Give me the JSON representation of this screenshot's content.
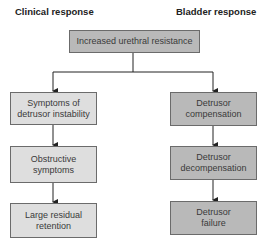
{
  "headers": {
    "left": "Clinical response",
    "right": "Bladder response"
  },
  "root": {
    "label": "Increased urethral resistance"
  },
  "clinical_response": [
    {
      "label": "Symptoms of detrusor instability"
    },
    {
      "label": "Obstructive symptoms"
    },
    {
      "label": "Large residual retention"
    }
  ],
  "bladder_response": [
    {
      "label": "Detrusor compensation"
    },
    {
      "label": "Detrusor decompensation"
    },
    {
      "label": "Detrusor failure"
    }
  ],
  "colors": {
    "light_box": "#dedede",
    "dark_box": "#b9b9b9",
    "border": "#6b6b6b",
    "line": "#222222"
  }
}
